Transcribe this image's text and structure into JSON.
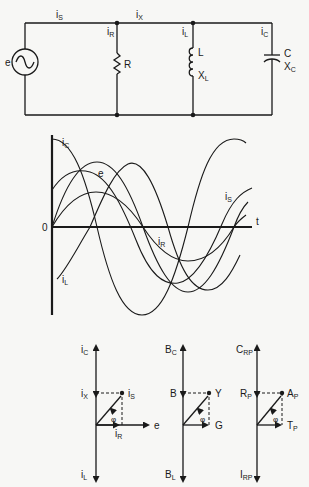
{
  "circuit": {
    "source_label": "e",
    "source_icon": "ac-source-icon",
    "currents": {
      "is": {
        "main": "i",
        "sub": "S"
      },
      "ix": {
        "main": "i",
        "sub": "X"
      },
      "ir": {
        "main": "i",
        "sub": "R"
      },
      "il": {
        "main": "i",
        "sub": "L"
      },
      "ic": {
        "main": "i",
        "sub": "C"
      }
    },
    "resistor": {
      "label": "R"
    },
    "inductor": {
      "label": "L",
      "reactance_main": "X",
      "reactance_sub": "L"
    },
    "capacitor": {
      "label": "C",
      "reactance_main": "X",
      "reactance_sub": "C"
    }
  },
  "waveform": {
    "origin_label": "0",
    "time_label": "t",
    "curves": [
      {
        "name": "iC",
        "main": "i",
        "sub": "C",
        "phase": "leads e by 90°"
      },
      {
        "name": "e",
        "main": "e",
        "sub": "",
        "phase": "reference"
      },
      {
        "name": "iS",
        "main": "i",
        "sub": "S",
        "phase": "leads e by φ"
      },
      {
        "name": "iR",
        "main": "i",
        "sub": "R",
        "phase": "in phase with e"
      },
      {
        "name": "iL",
        "main": "i",
        "sub": "L",
        "phase": "lags e by 90°"
      }
    ]
  },
  "phasors": [
    {
      "id": "current",
      "top": {
        "main": "i",
        "sub": "C"
      },
      "mid": {
        "main": "i",
        "sub": "X"
      },
      "bottom": {
        "main": "i",
        "sub": "L"
      },
      "resultant": {
        "main": "i",
        "sub": "S"
      },
      "horizontal": {
        "main": "i",
        "sub": "R"
      },
      "reference": "e",
      "angle": "φ"
    },
    {
      "id": "admittance",
      "top": {
        "main": "B",
        "sub": "C"
      },
      "mid": {
        "main": "B",
        "sub": ""
      },
      "bottom": {
        "main": "B",
        "sub": "L"
      },
      "resultant": {
        "main": "Y",
        "sub": ""
      },
      "horizontal": {
        "main": "G",
        "sub": ""
      },
      "angle": "φ"
    },
    {
      "id": "power",
      "top": {
        "main": "C",
        "sub": "RP"
      },
      "mid": {
        "main": "R",
        "sub": "P"
      },
      "bottom": {
        "main": "I",
        "sub": "RP"
      },
      "resultant": {
        "main": "A",
        "sub": "P"
      },
      "horizontal": {
        "main": "T",
        "sub": "P"
      },
      "angle": "φ"
    }
  ]
}
